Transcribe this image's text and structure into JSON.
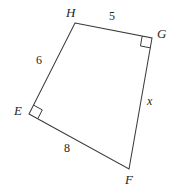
{
  "figure": {
    "shape_type": "quadrilateral",
    "background_color": "#ffffff",
    "stroke_color": "#3a3a3a",
    "text_color": "#262626",
    "vertices": [
      {
        "name": "H",
        "label": "H",
        "x": 75,
        "y": 23,
        "label_x": 66,
        "label_y": 6
      },
      {
        "name": "G",
        "label": "G",
        "x": 152,
        "y": 38,
        "label_x": 157,
        "label_y": 27
      },
      {
        "name": "F",
        "label": "F",
        "x": 129,
        "y": 169,
        "label_x": 125,
        "label_y": 173
      },
      {
        "name": "E",
        "label": "E",
        "x": 29,
        "y": 114,
        "label_x": 14,
        "label_y": 104
      }
    ],
    "sides": [
      {
        "name": "HG",
        "from": "H",
        "to": "G",
        "label": "5",
        "label_x": 109,
        "label_y": 10,
        "is_variable": false
      },
      {
        "name": "GF",
        "from": "G",
        "to": "F",
        "label": "x",
        "label_x": 147,
        "label_y": 95,
        "is_variable": true
      },
      {
        "name": "FE",
        "from": "F",
        "to": "E",
        "label": "8",
        "label_x": 64,
        "label_y": 142,
        "is_variable": false
      },
      {
        "name": "EH",
        "from": "E",
        "to": "H",
        "label": "6",
        "label_x": 36,
        "label_y": 54,
        "is_variable": false
      }
    ],
    "right_angles": [
      {
        "name": "right-angle-at-G",
        "at_vertex": "G",
        "size": 10
      },
      {
        "name": "right-angle-at-E",
        "at_vertex": "E",
        "size": 10
      }
    ]
  }
}
